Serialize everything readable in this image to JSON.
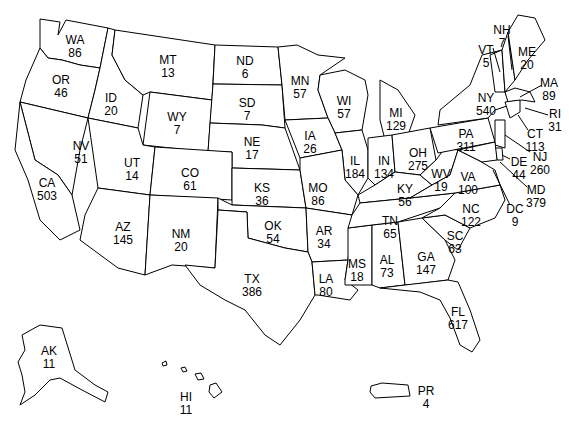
{
  "map": {
    "title": "",
    "states": [
      {
        "abbr": "WA",
        "value": "86",
        "x": 75,
        "y": 34
      },
      {
        "abbr": "OR",
        "value": "46",
        "x": 61,
        "y": 74
      },
      {
        "abbr": "ID",
        "value": "20",
        "x": 111,
        "y": 92
      },
      {
        "abbr": "MT",
        "value": "13",
        "x": 168,
        "y": 54
      },
      {
        "abbr": "WY",
        "value": "7",
        "x": 177,
        "y": 111
      },
      {
        "abbr": "ND",
        "value": "6",
        "x": 245,
        "y": 55
      },
      {
        "abbr": "SD",
        "value": "7",
        "x": 247,
        "y": 97
      },
      {
        "abbr": "NE",
        "value": "17",
        "x": 252,
        "y": 136
      },
      {
        "abbr": "MN",
        "value": "57",
        "x": 300,
        "y": 75
      },
      {
        "abbr": "WI",
        "value": "57",
        "x": 344,
        "y": 95
      },
      {
        "abbr": "MI",
        "value": "129",
        "x": 396,
        "y": 107
      },
      {
        "abbr": "IA",
        "value": "26",
        "x": 310,
        "y": 130
      },
      {
        "abbr": "IL",
        "value": "184",
        "x": 355,
        "y": 155
      },
      {
        "abbr": "IN",
        "value": "134",
        "x": 384,
        "y": 155
      },
      {
        "abbr": "OH",
        "value": "275",
        "x": 418,
        "y": 147
      },
      {
        "abbr": "NY",
        "value": "540",
        "x": 486,
        "y": 92
      },
      {
        "abbr": "PA",
        "value": "311",
        "x": 466,
        "y": 128
      },
      {
        "abbr": "NV",
        "value": "51",
        "x": 81,
        "y": 140
      },
      {
        "abbr": "UT",
        "value": "14",
        "x": 132,
        "y": 157
      },
      {
        "abbr": "CO",
        "value": "61",
        "x": 190,
        "y": 167
      },
      {
        "abbr": "CA",
        "value": "503",
        "x": 47,
        "y": 177
      },
      {
        "abbr": "AZ",
        "value": "145",
        "x": 123,
        "y": 221
      },
      {
        "abbr": "NM",
        "value": "20",
        "x": 181,
        "y": 228
      },
      {
        "abbr": "KS",
        "value": "36",
        "x": 262,
        "y": 182
      },
      {
        "abbr": "MO",
        "value": "86",
        "x": 318,
        "y": 182
      },
      {
        "abbr": "OK",
        "value": "54",
        "x": 273,
        "y": 220
      },
      {
        "abbr": "AR",
        "value": "34",
        "x": 324,
        "y": 225
      },
      {
        "abbr": "TX",
        "value": "386",
        "x": 252,
        "y": 273
      },
      {
        "abbr": "LA",
        "value": "80",
        "x": 326,
        "y": 273
      },
      {
        "abbr": "MS",
        "value": "18",
        "x": 357,
        "y": 258
      },
      {
        "abbr": "AL",
        "value": "73",
        "x": 387,
        "y": 254
      },
      {
        "abbr": "TN",
        "value": "65",
        "x": 390,
        "y": 215
      },
      {
        "abbr": "KY",
        "value": "56",
        "x": 405,
        "y": 183
      },
      {
        "abbr": "WV",
        "value": "19",
        "x": 441,
        "y": 168
      },
      {
        "abbr": "VA",
        "value": "100",
        "x": 468,
        "y": 171
      },
      {
        "abbr": "NC",
        "value": "122",
        "x": 471,
        "y": 203
      },
      {
        "abbr": "SC",
        "value": "63",
        "x": 455,
        "y": 230
      },
      {
        "abbr": "GA",
        "value": "147",
        "x": 426,
        "y": 251
      },
      {
        "abbr": "FL",
        "value": "617",
        "x": 458,
        "y": 306
      },
      {
        "abbr": "VT",
        "value": "5",
        "x": 486,
        "y": 44
      },
      {
        "abbr": "NH",
        "value": "7",
        "x": 502,
        "y": 24
      },
      {
        "abbr": "ME",
        "value": "20",
        "x": 527,
        "y": 46
      },
      {
        "abbr": "MA",
        "value": "89",
        "x": 549,
        "y": 77
      },
      {
        "abbr": "RI",
        "value": "31",
        "x": 555,
        "y": 108
      },
      {
        "abbr": "CT",
        "value": "113",
        "x": 535,
        "y": 128
      },
      {
        "abbr": "NJ",
        "value": "260",
        "x": 540,
        "y": 151
      },
      {
        "abbr": "DE",
        "value": "44",
        "x": 519,
        "y": 156
      },
      {
        "abbr": "MD",
        "value": "379",
        "x": 536,
        "y": 184
      },
      {
        "abbr": "DC",
        "value": "9",
        "x": 515,
        "y": 203
      },
      {
        "abbr": "AK",
        "value": "11",
        "x": 49,
        "y": 345
      },
      {
        "abbr": "HI",
        "value": "11",
        "x": 186,
        "y": 391
      },
      {
        "abbr": "PR",
        "value": "4",
        "x": 426,
        "y": 385
      }
    ]
  }
}
